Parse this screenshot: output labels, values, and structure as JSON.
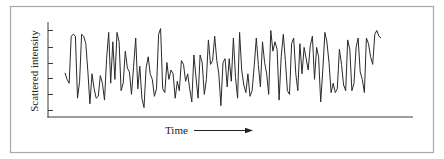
{
  "chart_data": {
    "type": "line",
    "title": "",
    "xlabel": "Time",
    "ylabel": "Scattered intensity",
    "xlabel_arrow": "right",
    "x_ticks": [],
    "y_ticks_count": 6,
    "y_tick_labels": [],
    "xlim": [
      0,
      100
    ],
    "ylim": [
      0,
      100
    ],
    "grid": false,
    "legend": "none",
    "series": [
      {
        "name": "Scattered intensity",
        "x": [
          0,
          0.6,
          1.2,
          1.8,
          2.4,
          3.0,
          3.6,
          4.2,
          4.8,
          5.4,
          6.0,
          6.6,
          7.2,
          7.8,
          8.4,
          9.0,
          9.6,
          10.2,
          10.8,
          11.4,
          12.0,
          12.6,
          13.2,
          13.8,
          14.4,
          15.0,
          15.6,
          16.2,
          16.8,
          17.4,
          18.0,
          18.6,
          19.2,
          19.8,
          20.4,
          21.0,
          21.6,
          22.2,
          22.8,
          23.4,
          24.0,
          24.6,
          25.2,
          25.8,
          26.4,
          27.0,
          27.6,
          28.2,
          28.8,
          29.4,
          30.0,
          30.6,
          31.2,
          31.8,
          32.4,
          33.0,
          33.6,
          34.2,
          34.8,
          35.4,
          36.0,
          36.6,
          37.2,
          37.8,
          38.4,
          39.0,
          39.6,
          40.2,
          40.8,
          41.4,
          42.0,
          42.6,
          43.2,
          43.8,
          44.4,
          45.0,
          45.6,
          46.2,
          46.8,
          47.4,
          48.0,
          48.6,
          49.2,
          49.8,
          50.4,
          51.0,
          51.6,
          52.2,
          52.8,
          53.4,
          54.0,
          54.6,
          55.2,
          55.8,
          56.4,
          57.0,
          57.6,
          58.2,
          58.8,
          59.4,
          60.0,
          60.6,
          61.2,
          61.8,
          62.4,
          63.0,
          63.6,
          64.2,
          64.8,
          65.4,
          66.0,
          66.6,
          67.2,
          67.8,
          68.4,
          69.0,
          69.6,
          70.2,
          70.8,
          71.4,
          72.0,
          72.6,
          73.2,
          73.8,
          74.4,
          75.0,
          75.6,
          76.2,
          76.8,
          77.4,
          78.0,
          78.6,
          79.2,
          79.8,
          80.4,
          81.0,
          81.6,
          82.2,
          82.8,
          83.4,
          84.0,
          84.6,
          85.2,
          85.8,
          86.4,
          87.0,
          87.6,
          88.2,
          88.8,
          89.4,
          90.0,
          90.6,
          91.2
        ],
        "values": [
          47,
          40,
          36,
          86,
          88,
          86,
          20,
          38,
          88,
          86,
          78,
          48,
          14,
          46,
          30,
          20,
          22,
          44,
          36,
          18,
          62,
          90,
          36,
          80,
          40,
          90,
          80,
          28,
          36,
          70,
          52,
          48,
          24,
          54,
          84,
          30,
          54,
          20,
          10,
          52,
          64,
          46,
          40,
          22,
          30,
          88,
          94,
          30,
          26,
          58,
          40,
          50,
          46,
          20,
          38,
          28,
          60,
          56,
          38,
          46,
          30,
          16,
          66,
          42,
          20,
          66,
          58,
          24,
          40,
          82,
          56,
          60,
          86,
          60,
          46,
          12,
          58,
          62,
          32,
          62,
          38,
          84,
          42,
          20,
          90,
          50,
          34,
          26,
          46,
          22,
          28,
          54,
          84,
          56,
          32,
          80,
          58,
          46,
          24,
          92,
          70,
          80,
          72,
          18,
          64,
          88,
          60,
          28,
          24,
          78,
          84,
          46,
          28,
          78,
          46,
          74,
          62,
          50,
          76,
          86,
          40,
          74,
          64,
          16,
          50,
          90,
          80,
          58,
          26,
          36,
          26,
          30,
          72,
          56,
          34,
          28,
          82,
          72,
          28,
          36,
          74,
          84,
          48,
          40,
          26,
          84,
          78,
          64,
          56,
          88,
          92,
          86,
          84
        ],
        "color": "#2a2a2a"
      }
    ]
  }
}
